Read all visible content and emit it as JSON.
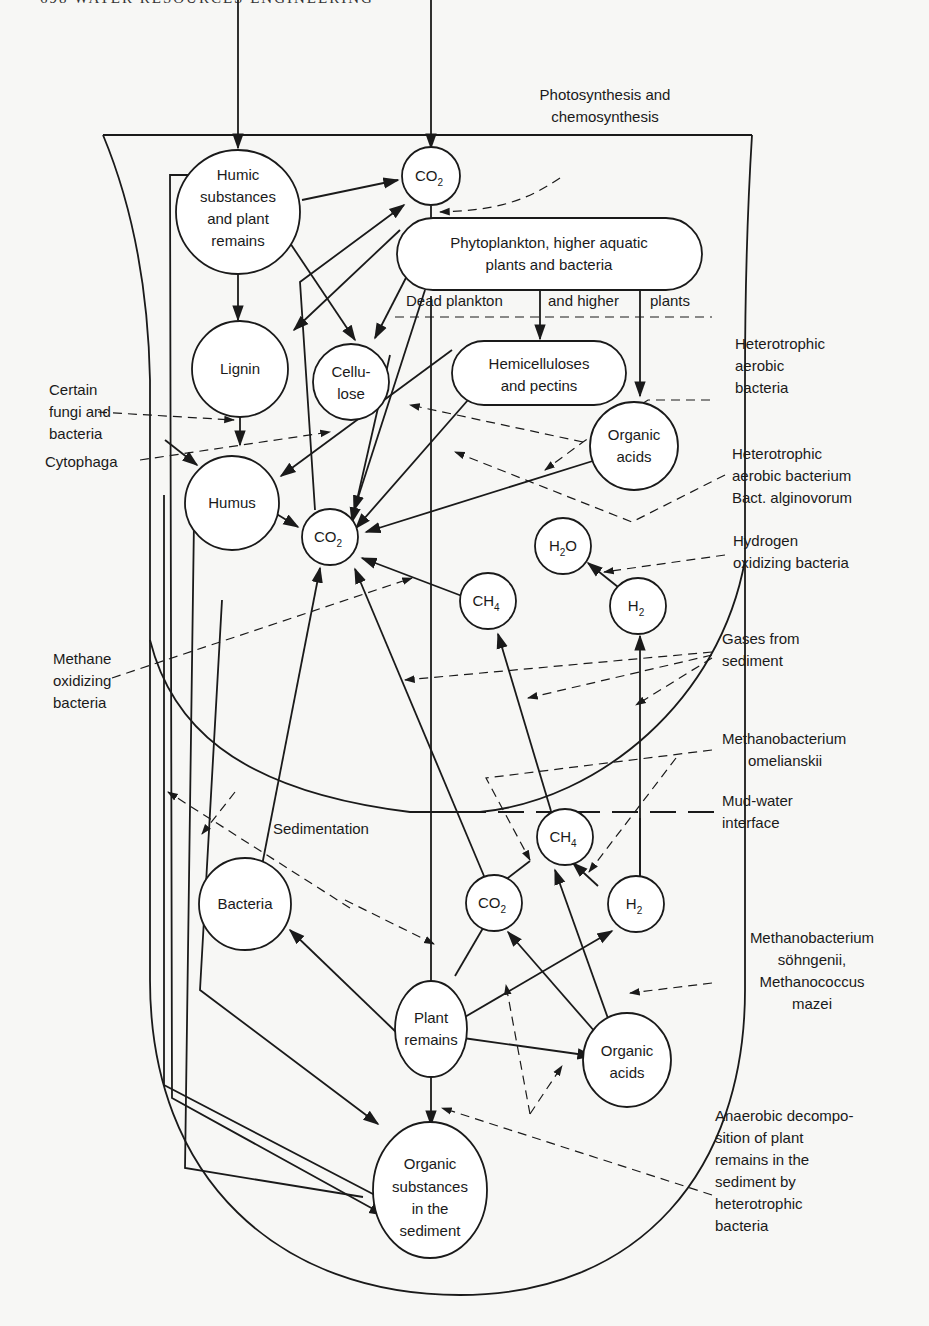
{
  "page": {
    "header": "698   WATER RESOURCES ENGINEERING"
  },
  "nodes": {
    "humic": [
      "Humic",
      "substances",
      "and plant",
      "remains"
    ],
    "co2_top": {
      "main": "CO",
      "sub": "2"
    },
    "phyto": [
      "Phytoplankton, higher aquatic",
      "plants and bacteria"
    ],
    "dead_plankton": {
      "a": "Dead plankton",
      "b": "and higher",
      "c": "plants"
    },
    "lignin": "Lignin",
    "cellulose": [
      "Cellu-",
      "lose"
    ],
    "hemicellulose": [
      "Hemicelluloses",
      "and pectins"
    ],
    "organic_acids_top": [
      "Organic",
      "acids"
    ],
    "humus": "Humus",
    "co2_mid": {
      "main": "CO",
      "sub": "2"
    },
    "h2o": {
      "a": "H",
      "sub": "2",
      "b": "O"
    },
    "ch4_mid": {
      "main": "CH",
      "sub": "4"
    },
    "h2_mid": {
      "main": "H",
      "sub": "2"
    },
    "ch4_low": {
      "main": "CH",
      "sub": "4"
    },
    "co2_low": {
      "main": "CO",
      "sub": "2"
    },
    "h2_low": {
      "main": "H",
      "sub": "2"
    },
    "bacteria": "Bacteria",
    "plant_remains": [
      "Plant",
      "remains"
    ],
    "organic_acids_low": [
      "Organic",
      "acids"
    ],
    "organic_sediment": [
      "Organic",
      "substances",
      "in the",
      "sediment"
    ]
  },
  "labels": {
    "photosynthesis": [
      "Photosynthesis and",
      "chemosynthesis"
    ],
    "hetero_aerobic": [
      "Heterotrophic",
      "aerobic",
      "bacteria"
    ],
    "certain_fungi": [
      "Certain",
      "fungi and",
      "bacteria"
    ],
    "cytophaga": "Cytophaga",
    "hetero_alginovorum": [
      "Heterotrophic",
      "aerobic bacterium",
      "Bact. alginovorum"
    ],
    "hydrogen_oxidizing": [
      "Hydrogen",
      "oxidizing bacteria"
    ],
    "gases_sediment": [
      "Gases from",
      "sediment"
    ],
    "methane_oxidizing": [
      "Methane",
      "oxidizing",
      "bacteria"
    ],
    "omelianskii": [
      "Methanobacterium",
      "omelianskii"
    ],
    "mud_water": [
      "Mud-water",
      "interface"
    ],
    "sedimentation": "Sedimentation",
    "sohngenii": [
      "Methanobacterium",
      "söhngenii,",
      "Methanococcus",
      "mazei"
    ],
    "anaerobic": [
      "Anaerobic decompo-",
      "sition of plant",
      "remains in the",
      "sediment by",
      "heterotrophic",
      "bacteria"
    ]
  }
}
